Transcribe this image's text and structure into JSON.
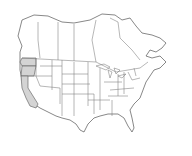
{
  "map": {
    "region": "North America (Canada, United States)",
    "highlighted_regions": [
      "Washington",
      "Oregon",
      "California"
    ],
    "colors": {
      "highlight": "#d4d4d4",
      "land": "#ffffff",
      "borders": "#7a7a7a",
      "background": "#ffffff"
    }
  }
}
